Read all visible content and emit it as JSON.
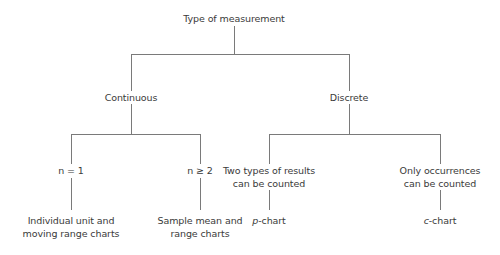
{
  "diagram": {
    "type": "decision-tree",
    "root": "Type of measurement",
    "level1": {
      "continuous": "Continuous",
      "discrete": "Discrete"
    },
    "level2": {
      "n1": "n = 1",
      "n2": "n ≥ 2",
      "two_types_line1": "Two types of results",
      "two_types_line2": "can be counted",
      "only_occ_line1": "Only occurrences",
      "only_occ_line2": "can be counted"
    },
    "leaves": {
      "individual_line1": "Individual unit and",
      "individual_line2": "moving range charts",
      "sample_line1": "Sample mean and",
      "sample_line2": "range charts",
      "p_prefix": "p",
      "p_suffix": "-chart",
      "c_prefix": "c",
      "c_suffix": "-chart"
    },
    "line_color": "#7a7a7a"
  }
}
